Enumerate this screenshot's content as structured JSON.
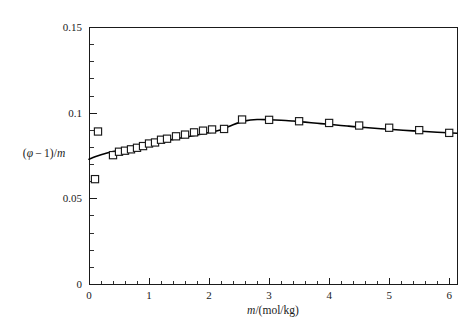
{
  "chart_data": {
    "type": "scatter",
    "title": "",
    "subtitle": "",
    "xlabel": "m/(mol/kg)",
    "xlabel_parts": {
      "italic": "m",
      "rest": "/(mol/kg)"
    },
    "ylabel": "(φ−1)/m",
    "ylabel_parts": {
      "open": "(",
      "phi": "φ",
      "minus": "−",
      "one": "1",
      "close": ")/",
      "m": "m"
    },
    "xlim": [
      0,
      6.13
    ],
    "ylim": [
      0,
      0.15
    ],
    "grid": false,
    "legend": null,
    "legend_position": "none",
    "x_ticks_major": [
      0,
      1,
      2,
      3,
      4,
      5,
      6
    ],
    "x_tick_labels": [
      "0",
      "1",
      "2",
      "3",
      "4",
      "5",
      "6"
    ],
    "x_minor_step": 0.2,
    "y_ticks_major": [
      0,
      0.05,
      0.1,
      0.15
    ],
    "y_tick_labels": [
      "0",
      "0.05",
      "0.1",
      "0.15"
    ],
    "y_minor_step": 0.01,
    "marker_style": "open-square",
    "curve_style": "solid-black-line",
    "series": [
      {
        "name": "experimental points",
        "marker": "open-square",
        "points": [
          {
            "x": 0.1,
            "y": 0.0612
          },
          {
            "x": 0.15,
            "y": 0.089
          },
          {
            "x": 0.4,
            "y": 0.0752
          },
          {
            "x": 0.5,
            "y": 0.0772
          },
          {
            "x": 0.6,
            "y": 0.0778
          },
          {
            "x": 0.7,
            "y": 0.0786
          },
          {
            "x": 0.8,
            "y": 0.0795
          },
          {
            "x": 0.9,
            "y": 0.0805
          },
          {
            "x": 1.0,
            "y": 0.082
          },
          {
            "x": 1.1,
            "y": 0.0826
          },
          {
            "x": 1.2,
            "y": 0.0842
          },
          {
            "x": 1.3,
            "y": 0.0848
          },
          {
            "x": 1.45,
            "y": 0.0862
          },
          {
            "x": 1.6,
            "y": 0.0872
          },
          {
            "x": 1.75,
            "y": 0.0885
          },
          {
            "x": 1.9,
            "y": 0.0895
          },
          {
            "x": 2.05,
            "y": 0.0902
          },
          {
            "x": 2.25,
            "y": 0.0905
          },
          {
            "x": 2.55,
            "y": 0.096
          },
          {
            "x": 3.0,
            "y": 0.0958
          },
          {
            "x": 3.5,
            "y": 0.095
          },
          {
            "x": 4.0,
            "y": 0.094
          },
          {
            "x": 4.5,
            "y": 0.0925
          },
          {
            "x": 5.0,
            "y": 0.0912
          },
          {
            "x": 5.5,
            "y": 0.0898
          },
          {
            "x": 6.0,
            "y": 0.0882
          }
        ]
      }
    ],
    "fit_curve": {
      "name": "model fit",
      "points": [
        {
          "x": 0.0,
          "y": 0.0728
        },
        {
          "x": 0.1,
          "y": 0.0742
        },
        {
          "x": 0.2,
          "y": 0.0754
        },
        {
          "x": 0.3,
          "y": 0.0764
        },
        {
          "x": 0.4,
          "y": 0.0773
        },
        {
          "x": 0.5,
          "y": 0.0781
        },
        {
          "x": 0.6,
          "y": 0.0789
        },
        {
          "x": 0.7,
          "y": 0.0796
        },
        {
          "x": 0.8,
          "y": 0.0803
        },
        {
          "x": 0.9,
          "y": 0.081
        },
        {
          "x": 1.0,
          "y": 0.0817
        },
        {
          "x": 1.2,
          "y": 0.0831
        },
        {
          "x": 1.4,
          "y": 0.0844
        },
        {
          "x": 1.6,
          "y": 0.0857
        },
        {
          "x": 1.8,
          "y": 0.087
        },
        {
          "x": 2.0,
          "y": 0.0884
        },
        {
          "x": 2.2,
          "y": 0.09
        },
        {
          "x": 2.4,
          "y": 0.093
        },
        {
          "x": 2.6,
          "y": 0.0952
        },
        {
          "x": 2.8,
          "y": 0.096
        },
        {
          "x": 3.0,
          "y": 0.0959
        },
        {
          "x": 3.2,
          "y": 0.0956
        },
        {
          "x": 3.4,
          "y": 0.0951
        },
        {
          "x": 3.6,
          "y": 0.0945
        },
        {
          "x": 3.8,
          "y": 0.0938
        },
        {
          "x": 4.0,
          "y": 0.0932
        },
        {
          "x": 4.3,
          "y": 0.0922
        },
        {
          "x": 4.6,
          "y": 0.0913
        },
        {
          "x": 5.0,
          "y": 0.0903
        },
        {
          "x": 5.4,
          "y": 0.0894
        },
        {
          "x": 5.8,
          "y": 0.0886
        },
        {
          "x": 6.13,
          "y": 0.088
        }
      ]
    },
    "colors": {
      "axis": "#1a1a1a",
      "curve": "#000000",
      "marker_fill": "#ffffff",
      "marker_stroke": "#1a1a1a",
      "background": "#ffffff"
    }
  },
  "geometry": {
    "plot_left": 89,
    "plot_right": 457,
    "plot_top": 27,
    "plot_bottom": 284,
    "marker_size": 7.2
  }
}
